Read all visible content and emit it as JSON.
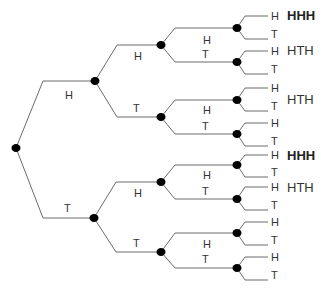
{
  "diagram": {
    "title": "",
    "type": "probability-tree",
    "colors": {
      "edge": "#6b6b6b",
      "node": "#000000",
      "text": "#333333"
    },
    "root": {
      "x": 16,
      "y": 148
    },
    "level1": [
      {
        "label": "H",
        "x": 95,
        "y": 81,
        "label_x": 65,
        "label_y": 99
      },
      {
        "label": "T",
        "x": 94,
        "y": 218,
        "label_x": 64,
        "label_y": 212
      }
    ],
    "level2": [
      {
        "label": "H",
        "x": 161,
        "y": 45,
        "label_x": 134,
        "label_y": 60
      },
      {
        "label": "T",
        "x": 161,
        "y": 117,
        "label_x": 133,
        "label_y": 112
      },
      {
        "label": "H",
        "x": 161,
        "y": 182,
        "label_x": 134,
        "label_y": 197
      },
      {
        "label": "T",
        "x": 161,
        "y": 252,
        "label_x": 133,
        "label_y": 247
      }
    ],
    "level3": [
      {
        "label": "H",
        "x": 237,
        "y": 28,
        "label_x": 203,
        "label_y": 44
      },
      {
        "label": "T",
        "x": 237,
        "y": 62,
        "label_x": 202,
        "label_y": 58
      },
      {
        "label": "H",
        "x": 237,
        "y": 100,
        "label_x": 203,
        "label_y": 114
      },
      {
        "label": "T",
        "x": 237,
        "y": 134,
        "label_x": 202,
        "label_y": 130
      },
      {
        "label": "H",
        "x": 237,
        "y": 165,
        "label_x": 203,
        "label_y": 179
      },
      {
        "label": "T",
        "x": 237,
        "y": 199,
        "label_x": 202,
        "label_y": 195
      },
      {
        "label": "H",
        "x": 237,
        "y": 233,
        "label_x": 203,
        "label_y": 248
      },
      {
        "label": "T",
        "x": 237,
        "y": 268,
        "label_x": 202,
        "label_y": 263
      }
    ],
    "leaves": [
      {
        "label": "H",
        "y": 16
      },
      {
        "label": "T",
        "y": 39
      },
      {
        "label": "H",
        "y": 51
      },
      {
        "label": "T",
        "y": 74
      },
      {
        "label": "H",
        "y": 88
      },
      {
        "label": "T",
        "y": 111
      },
      {
        "label": "H",
        "y": 123
      },
      {
        "label": "T",
        "y": 146
      },
      {
        "label": "H",
        "y": 155
      },
      {
        "label": "T",
        "y": 177
      },
      {
        "label": "H",
        "y": 187
      },
      {
        "label": "T",
        "y": 210
      },
      {
        "label": "H",
        "y": 222
      },
      {
        "label": "T",
        "y": 245
      },
      {
        "label": "H",
        "y": 257
      },
      {
        "label": "T",
        "y": 280
      }
    ],
    "outcome_labels": [
      {
        "text": "HHH",
        "x": 287,
        "y": 20,
        "bold": true
      },
      {
        "text": "HTH",
        "x": 287,
        "y": 55,
        "bold": false
      },
      {
        "text": "HTH",
        "x": 287,
        "y": 104,
        "bold": false
      },
      {
        "text": "HHH",
        "x": 287,
        "y": 160,
        "bold": true
      },
      {
        "text": "HTH",
        "x": 287,
        "y": 192,
        "bold": false
      }
    ]
  }
}
